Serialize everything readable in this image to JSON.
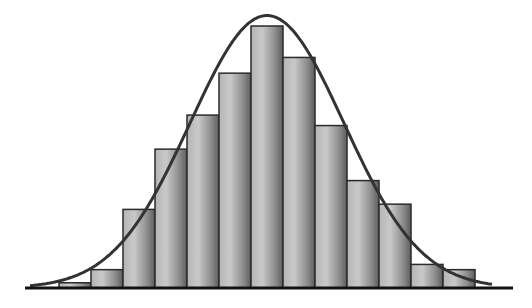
{
  "chart_data": {
    "type": "bar",
    "subtype": "histogram-with-normal-curve",
    "title": "",
    "xlabel": "",
    "ylabel": "",
    "grid": false,
    "legend": null,
    "categories": [
      "1",
      "2",
      "3",
      "4",
      "5",
      "6",
      "7",
      "8",
      "9",
      "10",
      "11",
      "12",
      "13"
    ],
    "values": [
      2,
      7,
      30,
      53,
      66,
      82,
      100,
      88,
      62,
      41,
      32,
      9,
      7
    ],
    "ylim": [
      0,
      105
    ],
    "overlay_curve": {
      "type": "normal",
      "label": "",
      "peak_relative": 104,
      "center_bin": 7,
      "sd_bins": 2.4
    },
    "colors": {
      "bar_light": "#c8c8c8",
      "bar_dark": "#6a6a6a",
      "bar_border": "#2a2a2a",
      "curve": "#333333",
      "axis": "#111111",
      "background": "#ffffff"
    }
  },
  "layout": {
    "baseline_y": 288,
    "axis_x0": 25,
    "axis_x1": 513,
    "first_bar_x": 59,
    "bar_width": 32,
    "plot_top_y": 22,
    "pixels_per_unit": 2.6
  }
}
